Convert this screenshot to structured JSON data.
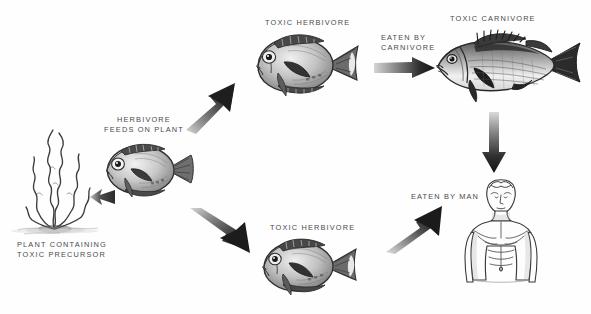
{
  "figure": {
    "domain": "diagram",
    "background_color": "#fefefe",
    "ink_color": "#3a3a3a",
    "label_color": "#4a4a4a"
  },
  "nodes": [
    {
      "id": "plant",
      "name": "plant-containing-toxic-precursor",
      "label": "PLANT CONTAINING\nTOXIC PRECURSOR",
      "label_x": 17,
      "label_y": 240,
      "art_x": 10,
      "art_y": 124,
      "art_w": 95,
      "art_h": 112,
      "kind": "algae"
    },
    {
      "id": "herbivore",
      "name": "herbivore-feeds-on-plant",
      "label": "HERBIVORE\nFEEDS ON PLANT",
      "label_x": 98,
      "label_y": 115,
      "art_x": 95,
      "art_y": 138,
      "art_w": 105,
      "art_h": 68,
      "kind": "surgeonfish"
    },
    {
      "id": "toxic_herbivore_top",
      "name": "toxic-herbivore-top",
      "label": "TOXIC HERBIVORE",
      "label_x": 265,
      "label_y": 18,
      "art_x": 244,
      "art_y": 28,
      "art_w": 122,
      "art_h": 78,
      "kind": "surgeonfish"
    },
    {
      "id": "toxic_herbivore_bottom",
      "name": "toxic-herbivore-bottom",
      "label": "TOXIC HERBIVORE",
      "label_x": 270,
      "label_y": 223,
      "art_x": 252,
      "art_y": 233,
      "art_w": 112,
      "art_h": 70,
      "kind": "surgeonfish"
    },
    {
      "id": "toxic_carnivore",
      "name": "toxic-carnivore",
      "label": "TOXIC CARNIVORE",
      "label_x": 450,
      "label_y": 14,
      "art_x": 428,
      "art_y": 28,
      "art_w": 160,
      "art_h": 76,
      "kind": "snapper"
    },
    {
      "id": "man",
      "name": "man-human-figure",
      "label": "EATEN BY MAN",
      "label_x": 409,
      "label_y": 192,
      "art_x": 462,
      "art_y": 176,
      "art_w": 78,
      "art_h": 112,
      "kind": "human-torso"
    }
  ],
  "arrows": [
    {
      "id": "a_fish_to_plant",
      "name": "arrow-herbivore-to-plant",
      "label": "",
      "from": "herbivore",
      "to": "plant",
      "direction": "left",
      "x": 88,
      "y": 186,
      "w": 28,
      "h": 22
    },
    {
      "id": "a_up",
      "name": "arrow-to-toxic-herbivore-top",
      "label": "",
      "from": "herbivore",
      "to": "toxic_herbivore_top",
      "direction": "up-right",
      "x": 186,
      "y": 74,
      "w": 66,
      "h": 60
    },
    {
      "id": "a_down",
      "name": "arrow-to-toxic-herbivore-bottom",
      "label": "",
      "from": "herbivore",
      "to": "toxic_herbivore_bottom",
      "direction": "down-right",
      "x": 190,
      "y": 208,
      "w": 76,
      "h": 62
    },
    {
      "id": "a_carnivore",
      "name": "arrow-eaten-by-carnivore",
      "label": "EATEN BY\nCARNIVORE",
      "label_x": 381,
      "label_y": 33,
      "from": "toxic_herbivore_top",
      "to": "toxic_carnivore",
      "direction": "right",
      "x": 374,
      "y": 57,
      "w": 62,
      "h": 22
    },
    {
      "id": "a_vertical",
      "name": "arrow-carnivore-to-man",
      "label": "",
      "from": "toxic_carnivore",
      "to": "man",
      "direction": "down",
      "x": 481,
      "y": 112,
      "w": 26,
      "h": 62
    },
    {
      "id": "a_man",
      "name": "arrow-eaten-by-man",
      "label": "",
      "from": "toxic_herbivore_bottom",
      "to": "man",
      "direction": "up-right",
      "x": 386,
      "y": 204,
      "w": 68,
      "h": 50
    }
  ]
}
